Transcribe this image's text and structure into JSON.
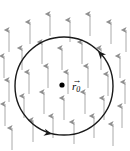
{
  "figure": {
    "background_color": "#ffffff",
    "width": 130,
    "height": 151
  },
  "field": {
    "name": "uniform-upward-vector-field",
    "arrow_color": "#a0a0a0",
    "arrow_head_color": "#8a8a8a",
    "direction": "up",
    "arrow_length": 22,
    "count": 30,
    "arrows": [
      {
        "x": 9,
        "y": 30
      },
      {
        "x": 30,
        "y": 22
      },
      {
        "x": 50,
        "y": 14
      },
      {
        "x": 70,
        "y": 20
      },
      {
        "x": 90,
        "y": 14
      },
      {
        "x": 111,
        "y": 22
      },
      {
        "x": 126,
        "y": 30
      },
      {
        "x": 4,
        "y": 56
      },
      {
        "x": 22,
        "y": 48
      },
      {
        "x": 42,
        "y": 42
      },
      {
        "x": 62,
        "y": 48
      },
      {
        "x": 82,
        "y": 42
      },
      {
        "x": 101,
        "y": 48
      },
      {
        "x": 120,
        "y": 56
      },
      {
        "x": 9,
        "y": 80
      },
      {
        "x": 29,
        "y": 72
      },
      {
        "x": 48,
        "y": 66
      },
      {
        "x": 68,
        "y": 72
      },
      {
        "x": 88,
        "y": 66
      },
      {
        "x": 108,
        "y": 74
      },
      {
        "x": 125,
        "y": 82
      },
      {
        "x": 5,
        "y": 104
      },
      {
        "x": 24,
        "y": 96
      },
      {
        "x": 44,
        "y": 92
      },
      {
        "x": 64,
        "y": 98
      },
      {
        "x": 85,
        "y": 92
      },
      {
        "x": 104,
        "y": 98
      },
      {
        "x": 122,
        "y": 106
      },
      {
        "x": 12,
        "y": 128
      },
      {
        "x": 33,
        "y": 120
      },
      {
        "x": 53,
        "y": 116
      },
      {
        "x": 74,
        "y": 122
      },
      {
        "x": 94,
        "y": 116
      },
      {
        "x": 113,
        "y": 124
      }
    ]
  },
  "loop": {
    "name": "circular-path",
    "stroke_color": "#1a1a1a",
    "stroke_width": 1.4,
    "center_x": 64,
    "center_y": 86,
    "radius": 49,
    "orientation": "counterclockwise",
    "arrowheads": [
      {
        "name": "loop-arrowhead-top-right",
        "x": 98,
        "y": 51,
        "angle": 228
      },
      {
        "name": "loop-arrowhead-bottom-left",
        "x": 52,
        "y": 134,
        "angle": 12
      }
    ]
  },
  "center_point": {
    "name": "position-vector-origin-dot",
    "x": 62,
    "y": 85,
    "radius": 2.6,
    "color": "#000000"
  },
  "labels": {
    "position_vector": {
      "text": "r",
      "subscript": "0",
      "arrow_glyph": "→",
      "x": 72,
      "y": 76,
      "color": "#000000"
    }
  },
  "caption": {
    "text": "",
    "visible": false,
    "color": "#cfcfcf"
  }
}
